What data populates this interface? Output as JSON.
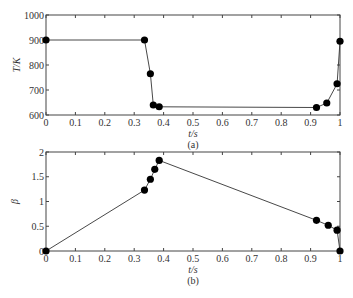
{
  "chart_data": [
    {
      "type": "line",
      "panel_label": "(a)",
      "xlabel": "t/s",
      "ylabel": "T/K",
      "xlim": [
        0,
        1
      ],
      "ylim": [
        600,
        1000
      ],
      "xticks": [
        "0",
        "0.1",
        "0.2",
        "0.3",
        "0.4",
        "0.5",
        "0.6",
        "0.7",
        "0.8",
        "0.9",
        "1"
      ],
      "yticks": [
        "600",
        "700",
        "800",
        "900",
        "1000"
      ],
      "grid": false,
      "marker": "filled-circle",
      "x": [
        0,
        0.335,
        0.355,
        0.365,
        0.385,
        0.92,
        0.955,
        0.99,
        1.0
      ],
      "y": [
        900,
        900,
        765,
        640,
        633,
        630,
        648,
        725,
        895
      ]
    },
    {
      "type": "line",
      "panel_label": "(b)",
      "xlabel": "t/s",
      "ylabel": "β",
      "xlim": [
        0,
        1
      ],
      "ylim": [
        0,
        2
      ],
      "xticks": [
        "0",
        "0.1",
        "0.2",
        "0.3",
        "0.4",
        "0.5",
        "0.6",
        "0.7",
        "0.8",
        "0.9",
        "1"
      ],
      "yticks": [
        "0",
        "0.5",
        "1",
        "1.5",
        "2"
      ],
      "grid": false,
      "marker": "filled-circle",
      "x": [
        0,
        0.335,
        0.355,
        0.37,
        0.385,
        0.92,
        0.96,
        0.99,
        1.0
      ],
      "y": [
        0,
        1.23,
        1.45,
        1.65,
        1.83,
        0.62,
        0.52,
        0.42,
        0
      ]
    }
  ],
  "colors": {
    "line": "#333333",
    "marker": "#000000",
    "axis": "#444444"
  }
}
